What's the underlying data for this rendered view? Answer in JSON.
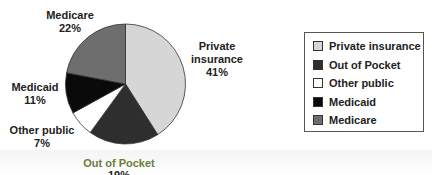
{
  "chart_data": {
    "type": "pie",
    "title": "",
    "start": "top",
    "direction": "clockwise",
    "slices": [
      {
        "label": "Private insurance",
        "display_label": [
          "Private",
          "insurance",
          "41%"
        ],
        "value": 41,
        "color": "#d6d6d6"
      },
      {
        "label": "Out of Pocket",
        "display_label": [
          "Out of Pocket",
          "19%"
        ],
        "value": 19,
        "color": "#2e2e2e"
      },
      {
        "label": "Other public",
        "display_label": [
          "Other public",
          "7%"
        ],
        "value": 7,
        "color": "#ffffff"
      },
      {
        "label": "Medicaid",
        "display_label": [
          "Medicaid",
          "11%"
        ],
        "value": 11,
        "color": "#0a0a0a"
      },
      {
        "label": "Medicare",
        "display_label": [
          "Medicare",
          "22%"
        ],
        "value": 22,
        "color": "#6e6e6e"
      }
    ],
    "legend": {
      "placement": "right",
      "entries": [
        "Private insurance",
        "Out of Pocket",
        "Other public",
        "Medicaid",
        "Medicare"
      ]
    }
  }
}
